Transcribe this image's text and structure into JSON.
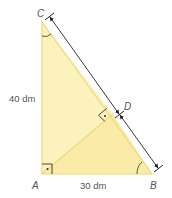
{
  "diagram": {
    "type": "right-triangle-altitude",
    "colors": {
      "fill": "#fbf0b4",
      "fill_dark": "#f7e69a",
      "edge": "#efd97a",
      "dimension_line": "#222222",
      "text": "#555555"
    },
    "points": {
      "A": {
        "label": "A",
        "x": 42,
        "y": 174
      },
      "B": {
        "label": "B",
        "x": 152,
        "y": 174
      },
      "C": {
        "label": "C",
        "x": 42,
        "y": 22
      },
      "D": {
        "label": "D",
        "x": 113,
        "y": 114
      }
    },
    "side_labels": {
      "AC": "40 dm",
      "AB": "30 dm"
    },
    "markers": {
      "right_angle_A": "right-angle with dot",
      "right_angle_D": "right-angle with dot",
      "angle_C": "arc",
      "angle_B": "arc"
    },
    "dimension": {
      "description": "double arrow segments C–D and D–B drawn parallel to hypotenuse CB"
    }
  }
}
